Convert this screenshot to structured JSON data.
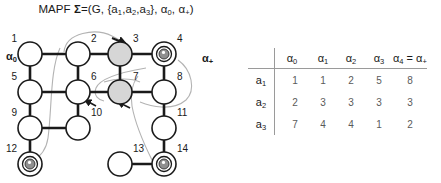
{
  "title": {
    "prefix": "MAPF ",
    "sigma": "Σ",
    "body": "=(G, {a",
    "full_text": "MAPF Σ=(G, {a1,a2,a3}, α0, α+)"
  },
  "labels": {
    "alpha_0": "α",
    "alpha_0_sub": "0",
    "alpha_plus": "α",
    "alpha_plus_sub": "+",
    "agents": [
      "a1",
      "a2",
      "a3"
    ]
  },
  "graph": {
    "nodes": [
      {
        "id": "1",
        "label": "1",
        "x": 30,
        "y": 32,
        "shaded": false,
        "token": null,
        "label_pos": "top-left"
      },
      {
        "id": "2",
        "label": "2",
        "x": 78,
        "y": 32,
        "shaded": false,
        "token": null,
        "label_pos": "top-right"
      },
      {
        "id": "3",
        "label": "3",
        "x": 120,
        "y": 32,
        "shaded": true,
        "token": null,
        "label_pos": "top-right"
      },
      {
        "id": "4",
        "label": "4",
        "x": 164,
        "y": 32,
        "shaded": false,
        "token": "agent",
        "label_pos": "top-right"
      },
      {
        "id": "5",
        "label": "5",
        "x": 30,
        "y": 70,
        "shaded": false,
        "token": null,
        "label_pos": "top-left"
      },
      {
        "id": "6",
        "label": "6",
        "x": 78,
        "y": 70,
        "shaded": false,
        "token": null,
        "label_pos": "top-right"
      },
      {
        "id": "7",
        "label": "7",
        "x": 120,
        "y": 70,
        "shaded": true,
        "token": null,
        "label_pos": "top-right"
      },
      {
        "id": "8",
        "label": "8",
        "x": 164,
        "y": 70,
        "shaded": false,
        "token": null,
        "label_pos": "top-right"
      },
      {
        "id": "9",
        "label": "9",
        "x": 30,
        "y": 106,
        "shaded": false,
        "token": null,
        "label_pos": "top-left"
      },
      {
        "id": "10",
        "label": "10",
        "x": 78,
        "y": 106,
        "shaded": false,
        "token": null,
        "label_pos": "top-right"
      },
      {
        "id": "11",
        "label": "11",
        "x": 164,
        "y": 106,
        "shaded": false,
        "token": null,
        "label_pos": "top-right"
      },
      {
        "id": "12",
        "label": "12",
        "x": 30,
        "y": 142,
        "shaded": false,
        "token": "agent",
        "label_pos": "top-left"
      },
      {
        "id": "13",
        "label": "13",
        "x": 120,
        "y": 142,
        "shaded": false,
        "token": null,
        "label_pos": "top-right"
      },
      {
        "id": "14",
        "label": "14",
        "x": 164,
        "y": 142,
        "shaded": false,
        "token": "agent",
        "label_pos": "top-right"
      }
    ],
    "edges": [
      [
        "1",
        "2"
      ],
      [
        "2",
        "3"
      ],
      [
        "3",
        "4"
      ],
      [
        "1",
        "5"
      ],
      [
        "2",
        "6"
      ],
      [
        "3",
        "7"
      ],
      [
        "4",
        "8"
      ],
      [
        "5",
        "6"
      ],
      [
        "6",
        "7"
      ],
      [
        "7",
        "8"
      ],
      [
        "5",
        "9"
      ],
      [
        "6",
        "10"
      ],
      [
        "8",
        "11"
      ],
      [
        "9",
        "10"
      ],
      [
        "9",
        "12"
      ],
      [
        "11",
        "14"
      ],
      [
        "13",
        "14"
      ]
    ]
  },
  "chart_data": {
    "type": "table",
    "columns": [
      "α₀",
      "α₁",
      "α₂",
      "α₃",
      "α₄ = α₊"
    ],
    "column_parts": [
      {
        "base": "α",
        "sub": "0",
        "suffix": ""
      },
      {
        "base": "α",
        "sub": "1",
        "suffix": ""
      },
      {
        "base": "α",
        "sub": "2",
        "suffix": ""
      },
      {
        "base": "α",
        "sub": "3",
        "suffix": ""
      },
      {
        "base": "α",
        "sub": "4",
        "suffix": " = α"
      }
    ],
    "row_labels": [
      "a₁",
      "a₂",
      "a₃"
    ],
    "row_label_parts": [
      {
        "base": "a",
        "sub": "1"
      },
      {
        "base": "a",
        "sub": "2"
      },
      {
        "base": "a",
        "sub": "3"
      }
    ],
    "rows": [
      {
        "agent": "a1",
        "values": [
          1,
          1,
          2,
          5,
          8
        ]
      },
      {
        "agent": "a2",
        "values": [
          2,
          3,
          3,
          3,
          3
        ]
      },
      {
        "agent": "a3",
        "values": [
          7,
          4,
          4,
          1,
          2
        ]
      }
    ]
  },
  "colors": {
    "node_stroke": "#1a1a1a",
    "node_fill": "#ffffff",
    "node_shaded_fill": "#d6d6d6",
    "edge": "#1a1a1a",
    "path_curve": "#b0b0b0",
    "token_fill": "#8f8f8f",
    "text": "#1a1a1a",
    "table_rule": "#9a9a9a",
    "table_value": "#5a5a5a"
  }
}
